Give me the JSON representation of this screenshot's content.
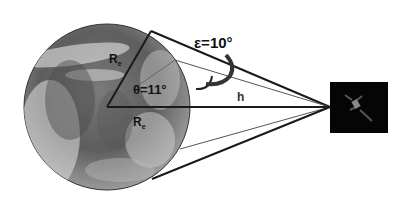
{
  "diagram": {
    "type": "satellite-earth-coverage-geometry",
    "labels": {
      "elevation_angle": "ε=10°",
      "central_angle": "θ=11°",
      "radius_upper": "R",
      "radius_upper_sub": "e",
      "radius_lower": "R",
      "radius_lower_sub": "e",
      "altitude": "h"
    },
    "colors": {
      "lines": "#1a1a1a",
      "thin_lines": "#555555",
      "satellite_box": "#050505",
      "earth_dark": "#4a4a4a",
      "earth_light": "#d8d8d8"
    }
  }
}
